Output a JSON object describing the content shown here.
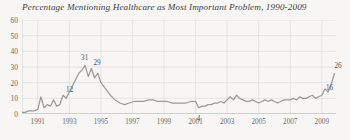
{
  "chart_data": {
    "type": "line",
    "title": "Percentage Mentioning Healthcare as Most Important Problem, 1990-2009",
    "xlabel": "",
    "ylabel": "",
    "ylim": [
      0,
      60
    ],
    "xlim": [
      1990,
      2009.9
    ],
    "yticks": [
      0,
      10,
      20,
      30,
      40,
      50,
      60
    ],
    "ytick_labels": [
      "0",
      "10",
      "20",
      "30",
      "40",
      "50",
      "60"
    ],
    "xticks": [
      1991,
      1993,
      1995,
      1997,
      1999,
      2001,
      2003,
      2005,
      2007,
      2009
    ],
    "xtick_labels": [
      "1991",
      "1993",
      "1995",
      "1997",
      "1999",
      "2001",
      "2003",
      "2005",
      "2007",
      "2009"
    ],
    "grid": true,
    "legend": "none",
    "line_color": "#9a9a9a",
    "series": [
      {
        "name": "Healthcare as Most Important Problem",
        "x": [
          1990.0,
          1990.2,
          1990.4,
          1990.6,
          1990.8,
          1991.0,
          1991.2,
          1991.4,
          1991.6,
          1991.8,
          1992.0,
          1992.2,
          1992.4,
          1992.6,
          1992.8,
          1993.0,
          1993.2,
          1993.4,
          1993.6,
          1993.8,
          1994.0,
          1994.2,
          1994.4,
          1994.6,
          1994.8,
          1995.0,
          1995.3,
          1995.6,
          1995.9,
          1996.2,
          1996.5,
          1996.8,
          1997.1,
          1997.4,
          1997.7,
          1998.0,
          1998.3,
          1998.6,
          1998.9,
          1999.2,
          1999.5,
          1999.8,
          2000.1,
          2000.4,
          2000.7,
          2001.0,
          2001.2,
          2001.4,
          2001.6,
          2001.8,
          2002.0,
          2002.2,
          2002.4,
          2002.6,
          2002.8,
          2003.0,
          2003.2,
          2003.4,
          2003.6,
          2003.8,
          2004.0,
          2004.2,
          2004.4,
          2004.6,
          2004.8,
          2005.0,
          2005.2,
          2005.4,
          2005.6,
          2005.8,
          2006.0,
          2006.2,
          2006.4,
          2006.6,
          2006.8,
          2007.0,
          2007.2,
          2007.4,
          2007.6,
          2007.8,
          2008.0,
          2008.2,
          2008.4,
          2008.6,
          2008.8,
          2009.0,
          2009.2,
          2009.4,
          2009.6,
          2009.8
        ],
        "y": [
          1,
          1,
          2,
          2,
          2,
          3,
          11,
          4,
          6,
          5,
          9,
          5,
          6,
          12,
          10,
          14,
          18,
          22,
          26,
          28,
          31,
          24,
          29,
          23,
          26,
          20,
          16,
          12,
          9,
          7,
          6,
          7,
          8,
          8,
          8,
          9,
          9,
          8,
          8,
          8,
          7,
          7,
          7,
          7,
          8,
          8,
          4,
          5,
          5,
          6,
          6,
          7,
          7,
          8,
          7,
          9,
          11,
          9,
          12,
          10,
          9,
          8,
          8,
          9,
          8,
          7,
          8,
          9,
          8,
          9,
          8,
          7,
          8,
          9,
          9,
          9,
          10,
          9,
          11,
          10,
          10,
          11,
          12,
          10,
          11,
          12,
          16,
          14,
          19,
          26
        ],
        "annotations": [
          {
            "label": "12",
            "x": 1992.6,
            "y": 12
          },
          {
            "label": "31",
            "x": 1994.0,
            "y": 31
          },
          {
            "label": "29",
            "x": 1994.4,
            "y": 29
          },
          {
            "label": "4",
            "x": 2001.2,
            "y": 4
          },
          {
            "label": "16",
            "x": 2009.2,
            "y": 16
          },
          {
            "label": "26",
            "x": 2009.8,
            "y": 26
          }
        ]
      }
    ]
  }
}
